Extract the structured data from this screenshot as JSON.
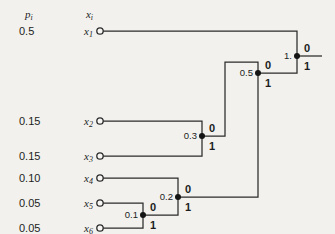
{
  "figure": {
    "type": "huffman-code-tree",
    "width": 335,
    "height": 234,
    "background": "#f2f1ee",
    "line_color": "#2b2b2b",
    "text_color": "#1d1d1d",
    "node_dot_color": "#141414",
    "leaf_circle_fill": "#f7f6f4"
  },
  "headers": {
    "prob_column": {
      "main": "p",
      "sub": "i",
      "x": 25,
      "y": 18
    },
    "symbol_column": {
      "main": "x",
      "sub": "i",
      "x": 93,
      "y": 18
    }
  },
  "columns": {
    "prob_x": 19,
    "symbol_x": 93,
    "circle_x": 100
  },
  "leaves": [
    {
      "probability": "0.5",
      "symbol": "x",
      "sub": "1",
      "y": 31
    },
    {
      "probability": "0.15",
      "symbol": "x",
      "sub": "2",
      "y": 121
    },
    {
      "probability": "0.15",
      "symbol": "x",
      "sub": "3",
      "y": 156
    },
    {
      "probability": "0.10",
      "symbol": "x",
      "sub": "4",
      "y": 178
    },
    {
      "probability": "0.05",
      "symbol": "x",
      "sub": "5",
      "y": 203
    },
    {
      "probability": "0.05",
      "symbol": "x",
      "sub": "6",
      "y": 228
    }
  ],
  "merge_nodes": [
    {
      "label": "0.1",
      "x": 143,
      "y": 215,
      "branch_upper": "0",
      "branch_lower": "1"
    },
    {
      "label": "0.2",
      "x": 178,
      "y": 197,
      "branch_upper": "0",
      "branch_lower": "1"
    },
    {
      "label": "0.3",
      "x": 202,
      "y": 136,
      "branch_upper": "0",
      "branch_lower": "1"
    },
    {
      "label": "0.5",
      "x": 258,
      "y": 73,
      "branch_upper": "0",
      "branch_lower": "1"
    },
    {
      "label": "1.",
      "x": 297,
      "y": 56,
      "branch_upper": "0",
      "branch_lower": "1"
    }
  ],
  "edges": [
    {
      "name": "edge-x1-to-root",
      "points": [
        [
          103,
          31
        ],
        [
          297,
          31
        ],
        [
          297,
          56
        ]
      ]
    },
    {
      "name": "edge-x2-to-n03",
      "points": [
        [
          103,
          121
        ],
        [
          202,
          121
        ],
        [
          202,
          136
        ]
      ]
    },
    {
      "name": "edge-x3-to-n03",
      "points": [
        [
          103,
          156
        ],
        [
          202,
          156
        ],
        [
          202,
          136
        ]
      ]
    },
    {
      "name": "edge-x4-to-n02",
      "points": [
        [
          103,
          178
        ],
        [
          178,
          178
        ],
        [
          178,
          197
        ]
      ]
    },
    {
      "name": "edge-x5-to-n01",
      "points": [
        [
          103,
          203
        ],
        [
          143,
          203
        ],
        [
          143,
          215
        ]
      ]
    },
    {
      "name": "edge-x6-to-n01",
      "points": [
        [
          103,
          228
        ],
        [
          143,
          228
        ],
        [
          143,
          215
        ]
      ]
    },
    {
      "name": "edge-n01-to-n02",
      "points": [
        [
          143,
          215
        ],
        [
          178,
          215
        ],
        [
          178,
          197
        ]
      ]
    },
    {
      "name": "edge-n02-to-n05",
      "points": [
        [
          178,
          197
        ],
        [
          258,
          197
        ],
        [
          258,
          73
        ]
      ]
    },
    {
      "name": "edge-n03-to-n05",
      "points": [
        [
          202,
          136
        ],
        [
          225,
          136
        ],
        [
          225,
          62
        ],
        [
          258,
          62
        ],
        [
          258,
          73
        ]
      ]
    },
    {
      "name": "edge-n05-to-root",
      "points": [
        [
          258,
          73
        ],
        [
          297,
          73
        ],
        [
          297,
          56
        ]
      ]
    },
    {
      "name": "edge-root-stem",
      "points": [
        [
          297,
          56
        ],
        [
          322,
          56
        ]
      ]
    }
  ]
}
